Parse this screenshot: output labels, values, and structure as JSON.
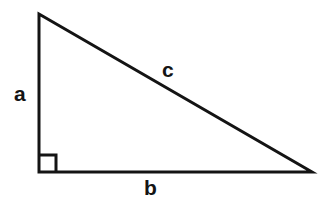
{
  "figure": {
    "name": "right-triangle",
    "background_color": "#ffffff",
    "stroke_color": "#141414",
    "stroke_width": 3,
    "width": 324,
    "height": 208
  },
  "geometry": {
    "apex": {
      "x": 39,
      "y": 14
    },
    "right_angle_vertex": {
      "x": 39,
      "y": 172
    },
    "base_right_vertex": {
      "x": 312,
      "y": 172
    },
    "right_angle_marker": {
      "size": 17,
      "path": "M 39 155 L 56 155 L 56 172"
    },
    "triangle_path": "M 39 14 L 312 172 L 39 172 Z"
  },
  "labels": {
    "leg_vertical": "a",
    "leg_horizontal": "b",
    "hypotenuse": "c"
  },
  "label_colors": {
    "text": "#141414"
  }
}
